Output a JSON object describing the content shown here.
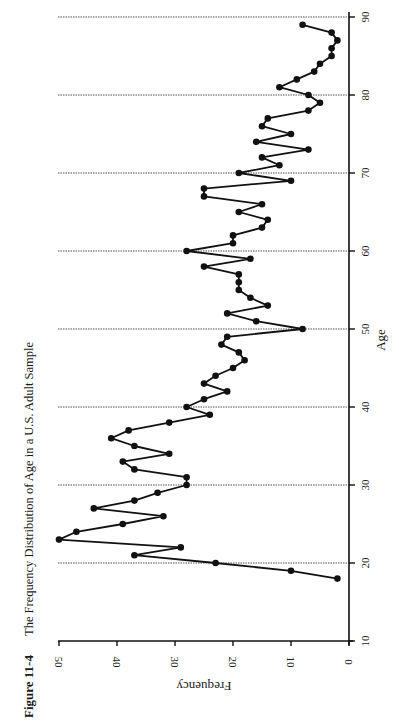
{
  "figure": {
    "label": "Figure 11-4",
    "caption": "The Frequency Distribution of Age in a U.S. Adult Sample"
  },
  "chart_data": {
    "type": "line",
    "title": "The Frequency Distribution of Age in a U.S. Adult Sample",
    "figure_label": "Figure 11-4",
    "xlabel": "Age",
    "ylabel": "Frequency",
    "orientation": "rotated 90° counter-clockwise on page (Age axis runs vertically on right, Frequency axis runs horizontally along bottom)",
    "xlim": [
      10,
      90
    ],
    "ylim": [
      0,
      50
    ],
    "x_ticks": [
      10,
      20,
      30,
      40,
      50,
      60,
      70,
      80,
      90
    ],
    "y_ticks": [
      0,
      10,
      20,
      30,
      40,
      50
    ],
    "grid": "dotted reference lines at ages 20, 30, 40, 50, 60, 70, 80, 90",
    "markers": "filled circles",
    "x": [
      18,
      19,
      20,
      21,
      22,
      23,
      24,
      25,
      26,
      27,
      28,
      29,
      30,
      31,
      32,
      33,
      34,
      35,
      36,
      37,
      38,
      39,
      40,
      41,
      42,
      43,
      44,
      45,
      46,
      47,
      48,
      49,
      50,
      51,
      52,
      53,
      54,
      55,
      56,
      57,
      58,
      59,
      60,
      61,
      62,
      63,
      64,
      65,
      66,
      67,
      68,
      69,
      70,
      71,
      72,
      73,
      74,
      75,
      76,
      77,
      78,
      79,
      80,
      81,
      82,
      83,
      84,
      85,
      86,
      87,
      88,
      89
    ],
    "values": [
      2,
      10,
      23,
      37,
      29,
      50,
      47,
      39,
      32,
      44,
      37,
      33,
      28,
      28,
      37,
      39,
      31,
      37,
      41,
      38,
      31,
      24,
      28,
      25,
      21,
      25,
      23,
      20,
      18,
      19,
      22,
      21,
      8,
      16,
      21,
      14,
      17,
      19,
      19,
      19,
      25,
      17,
      28,
      20,
      20,
      15,
      14,
      19,
      15,
      25,
      25,
      10,
      19,
      12,
      15,
      7,
      16,
      10,
      15,
      14,
      7,
      5,
      7,
      12,
      9,
      6,
      5,
      3,
      3,
      2,
      3,
      8
    ]
  }
}
